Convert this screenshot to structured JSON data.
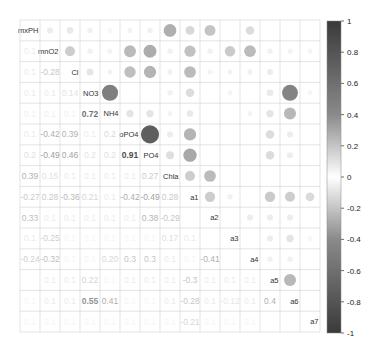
{
  "chart_data": {
    "type": "heatmap",
    "subtype": "correlation-matrix (corrplot mixed: upper=circle, lower=number, diagonal=labels)",
    "title": "",
    "variables": [
      "mxPH",
      "mnO2",
      "Cl",
      "NO3",
      "NH4",
      "oPO4",
      "PO4",
      "Chla",
      "a1",
      "a2",
      "a3",
      "a4",
      "a5",
      "a6",
      "a7"
    ],
    "colorbar": {
      "min": -1,
      "max": 1,
      "ticks": [
        "1",
        "0.8",
        "0.6",
        "0.4",
        "0.2",
        "0",
        "-0.2",
        "-0.4",
        "-0.6",
        "-0.8",
        "-1"
      ],
      "high_color": "#3a3a3a",
      "mid_color": "#ffffff",
      "low_color": "#3a3a3a"
    },
    "grid": true,
    "upper_circles": [
      {
        "r": 0,
        "c": 7,
        "v": 0.45
      },
      {
        "r": 0,
        "c": 8,
        "v": 0.22
      },
      {
        "r": 0,
        "c": 9,
        "v": 0.33
      },
      {
        "r": 0,
        "c": 11,
        "v": 0.2
      },
      {
        "r": 1,
        "c": 7,
        "v": 0.08
      },
      {
        "r": 1,
        "c": 8,
        "v": 0.35
      },
      {
        "r": 1,
        "c": 9,
        "v": 0.08
      },
      {
        "r": 1,
        "c": 10,
        "v": 0.3
      },
      {
        "r": 1,
        "c": 11,
        "v": 0.38
      },
      {
        "r": 1,
        "c": 12,
        "v": 0.08
      },
      {
        "r": 1,
        "c": 13,
        "v": 0.07
      },
      {
        "r": 1,
        "c": 14,
        "v": 0.06
      },
      {
        "r": 2,
        "c": 7,
        "v": 0.08
      },
      {
        "r": 2,
        "c": 8,
        "v": 0.38
      },
      {
        "r": 2,
        "c": 9,
        "v": 0.06
      },
      {
        "r": 2,
        "c": 10,
        "v": 0.07
      },
      {
        "r": 2,
        "c": 11,
        "v": 0.08
      },
      {
        "r": 2,
        "c": 12,
        "v": 0.1
      },
      {
        "r": 3,
        "c": 4,
        "v": 0.72
      },
      {
        "r": 3,
        "c": 7,
        "v": 0.08
      },
      {
        "r": 3,
        "c": 8,
        "v": 0.2
      },
      {
        "r": 3,
        "c": 10,
        "v": 0.06
      },
      {
        "r": 3,
        "c": 12,
        "v": 0.12
      },
      {
        "r": 3,
        "c": 13,
        "v": 0.7
      },
      {
        "r": 3,
        "c": 14,
        "v": 0.05
      },
      {
        "r": 4,
        "c": 5,
        "v": 0.15
      },
      {
        "r": 4,
        "c": 6,
        "v": 0.15
      },
      {
        "r": 4,
        "c": 7,
        "v": 0.06
      },
      {
        "r": 4,
        "c": 8,
        "v": 0.12
      },
      {
        "r": 4,
        "c": 11,
        "v": 0.06
      },
      {
        "r": 4,
        "c": 12,
        "v": 0.15
      },
      {
        "r": 4,
        "c": 13,
        "v": 0.4
      },
      {
        "r": 1,
        "c": 5,
        "v": 0.39
      },
      {
        "r": 1,
        "c": 6,
        "v": 0.46
      },
      {
        "r": 2,
        "c": 5,
        "v": 0.36
      },
      {
        "r": 2,
        "c": 6,
        "v": 0.42
      },
      {
        "r": 0,
        "c": 4,
        "v": 0.05
      },
      {
        "r": 0,
        "c": 5,
        "v": 0.07
      },
      {
        "r": 0,
        "c": 6,
        "v": 0.08
      },
      {
        "r": 0,
        "c": 1,
        "v": 0.1
      },
      {
        "r": 0,
        "c": 2,
        "v": 0.12
      },
      {
        "r": 0,
        "c": 3,
        "v": 0.08
      },
      {
        "r": 1,
        "c": 2,
        "v": 0.28
      },
      {
        "r": 1,
        "c": 3,
        "v": 0.08
      },
      {
        "r": 1,
        "c": 4,
        "v": 0.07
      },
      {
        "r": 2,
        "c": 3,
        "v": 0.14
      },
      {
        "r": 2,
        "c": 4,
        "v": 0.07
      },
      {
        "r": 5,
        "c": 6,
        "v": 0.91
      },
      {
        "r": 5,
        "c": 7,
        "v": 0.1
      },
      {
        "r": 5,
        "c": 8,
        "v": -0.42
      },
      {
        "r": 5,
        "c": 12,
        "v": 0.2
      },
      {
        "r": 5,
        "c": 13,
        "v": 0.1
      },
      {
        "r": 6,
        "c": 7,
        "v": 0.18
      },
      {
        "r": 6,
        "c": 8,
        "v": -0.49
      },
      {
        "r": 6,
        "c": 12,
        "v": 0.2
      },
      {
        "r": 6,
        "c": 13,
        "v": 0.1
      },
      {
        "r": 7,
        "c": 8,
        "v": -0.28
      },
      {
        "r": 7,
        "c": 9,
        "v": 0.38
      },
      {
        "r": 8,
        "c": 9,
        "v": -0.29
      },
      {
        "r": 8,
        "c": 10,
        "v": 0.08
      },
      {
        "r": 8,
        "c": 12,
        "v": -0.3
      },
      {
        "r": 8,
        "c": 13,
        "v": -0.28
      },
      {
        "r": 8,
        "c": 14,
        "v": -0.21
      },
      {
        "r": 9,
        "c": 11,
        "v": 0.1
      },
      {
        "r": 9,
        "c": 12,
        "v": 0.1
      },
      {
        "r": 9,
        "c": 13,
        "v": 0.1
      },
      {
        "r": 10,
        "c": 12,
        "v": 0.1
      },
      {
        "r": 10,
        "c": 13,
        "v": 0.15
      },
      {
        "r": 10,
        "c": 14,
        "v": 0.05
      },
      {
        "r": 11,
        "c": 12,
        "v": 0.08
      },
      {
        "r": 11,
        "c": 13,
        "v": 0.08
      },
      {
        "r": 12,
        "c": 13,
        "v": 0.4
      }
    ],
    "lower_numbers": [
      {
        "r": 1,
        "c": 0,
        "t": "0.1",
        "v": 0.1
      },
      {
        "r": 2,
        "c": 0,
        "t": "0.1",
        "v": 0.1
      },
      {
        "r": 2,
        "c": 1,
        "t": "-0.28",
        "v": -0.28
      },
      {
        "r": 3,
        "c": 0,
        "t": "0.1",
        "v": 0.1
      },
      {
        "r": 3,
        "c": 1,
        "t": "0.1",
        "v": 0.1
      },
      {
        "r": 3,
        "c": 2,
        "t": "0.14",
        "v": 0.14
      },
      {
        "r": 4,
        "c": 0,
        "t": "0.1",
        "v": 0.08
      },
      {
        "r": 4,
        "c": 1,
        "t": "0.1",
        "v": 0.08
      },
      {
        "r": 4,
        "c": 2,
        "t": "0.1",
        "v": 0.07
      },
      {
        "r": 4,
        "c": 3,
        "t": "0.72",
        "v": 0.72
      },
      {
        "r": 5,
        "c": 0,
        "t": "0.1",
        "v": 0.1
      },
      {
        "r": 5,
        "c": 1,
        "t": "-0.42",
        "v": -0.42
      },
      {
        "r": 5,
        "c": 2,
        "t": "0.39",
        "v": 0.39
      },
      {
        "r": 5,
        "c": 3,
        "t": "0.1",
        "v": 0.1
      },
      {
        "r": 5,
        "c": 4,
        "t": "0.2",
        "v": 0.2
      },
      {
        "r": 6,
        "c": 0,
        "t": "0.2",
        "v": 0.15
      },
      {
        "r": 6,
        "c": 1,
        "t": "-0.49",
        "v": -0.49
      },
      {
        "r": 6,
        "c": 2,
        "t": "0.46",
        "v": 0.46
      },
      {
        "r": 6,
        "c": 3,
        "t": "0.2",
        "v": 0.14
      },
      {
        "r": 6,
        "c": 4,
        "t": "0.2",
        "v": 0.15
      },
      {
        "r": 6,
        "c": 5,
        "t": "0.91",
        "v": 0.91
      },
      {
        "r": 7,
        "c": 0,
        "t": "0.39",
        "v": 0.39
      },
      {
        "r": 7,
        "c": 1,
        "t": "0.15",
        "v": 0.15
      },
      {
        "r": 7,
        "c": 2,
        "t": "0.1",
        "v": 0.1
      },
      {
        "r": 7,
        "c": 3,
        "t": "0.1",
        "v": 0.1
      },
      {
        "r": 7,
        "c": 4,
        "t": "0.1",
        "v": 0.1
      },
      {
        "r": 7,
        "c": 5,
        "t": "0.1",
        "v": 0.1
      },
      {
        "r": 7,
        "c": 6,
        "t": "0.27",
        "v": 0.27
      },
      {
        "r": 8,
        "c": 0,
        "t": "-0.27",
        "v": -0.27
      },
      {
        "r": 8,
        "c": 1,
        "t": "0.28",
        "v": 0.28
      },
      {
        "r": 8,
        "c": 2,
        "t": "-0.36",
        "v": -0.36
      },
      {
        "r": 8,
        "c": 3,
        "t": "0.21",
        "v": 0.21
      },
      {
        "r": 8,
        "c": 4,
        "t": "0.1",
        "v": 0.1
      },
      {
        "r": 8,
        "c": 5,
        "t": "-0.42",
        "v": -0.42
      },
      {
        "r": 8,
        "c": 6,
        "t": "-0.49",
        "v": -0.49
      },
      {
        "r": 8,
        "c": 7,
        "t": "0.28",
        "v": 0.28
      },
      {
        "r": 9,
        "c": 0,
        "t": "0.33",
        "v": 0.33
      },
      {
        "r": 9,
        "c": 1,
        "t": "0.1",
        "v": 0.1
      },
      {
        "r": 9,
        "c": 2,
        "t": "0.1",
        "v": 0.1
      },
      {
        "r": 9,
        "c": 3,
        "t": "0.1",
        "v": 0.1
      },
      {
        "r": 9,
        "c": 4,
        "t": "0.1",
        "v": 0.1
      },
      {
        "r": 9,
        "c": 5,
        "t": "0.1",
        "v": 0.1
      },
      {
        "r": 9,
        "c": 6,
        "t": "0.38",
        "v": 0.38
      },
      {
        "r": 9,
        "c": 7,
        "t": "-0.29",
        "v": -0.29
      },
      {
        "r": 10,
        "c": 0,
        "t": "0.1",
        "v": 0.1
      },
      {
        "r": 10,
        "c": 1,
        "t": "-0.25",
        "v": -0.25
      },
      {
        "r": 10,
        "c": 2,
        "t": "0.1",
        "v": 0.05
      },
      {
        "r": 10,
        "c": 3,
        "t": "0.1",
        "v": 0.05
      },
      {
        "r": 10,
        "c": 4,
        "t": "0.1",
        "v": 0.05
      },
      {
        "r": 10,
        "c": 5,
        "t": "0.1",
        "v": 0.05
      },
      {
        "r": 10,
        "c": 6,
        "t": "0.1",
        "v": 0.05
      },
      {
        "r": 10,
        "c": 7,
        "t": "0.17",
        "v": 0.17
      },
      {
        "r": 10,
        "c": 8,
        "t": "0.1",
        "v": 0.1
      },
      {
        "r": 11,
        "c": 0,
        "t": "-0.24",
        "v": -0.24
      },
      {
        "r": 11,
        "c": 1,
        "t": "-0.32",
        "v": -0.32
      },
      {
        "r": 11,
        "c": 2,
        "t": "0.1",
        "v": 0.05
      },
      {
        "r": 11,
        "c": 3,
        "t": "0.1",
        "v": 0.05
      },
      {
        "r": 11,
        "c": 4,
        "t": "0.20",
        "v": 0.2
      },
      {
        "r": 11,
        "c": 5,
        "t": "0.3",
        "v": 0.3
      },
      {
        "r": 11,
        "c": 6,
        "t": "0.3",
        "v": 0.3
      },
      {
        "r": 11,
        "c": 7,
        "t": "0.1",
        "v": 0.1
      },
      {
        "r": 11,
        "c": 8,
        "t": "0.1",
        "v": 0.05
      },
      {
        "r": 11,
        "c": 9,
        "t": "-0.41",
        "v": -0.41
      },
      {
        "r": 12,
        "c": 1,
        "t": "0.1",
        "v": 0.1
      },
      {
        "r": 12,
        "c": 2,
        "t": "0.1",
        "v": 0.1
      },
      {
        "r": 12,
        "c": 3,
        "t": "0.22",
        "v": 0.22
      },
      {
        "r": 12,
        "c": 4,
        "t": "0.1",
        "v": 0.05
      },
      {
        "r": 12,
        "c": 5,
        "t": "0.1",
        "v": 0.1
      },
      {
        "r": 12,
        "c": 6,
        "t": "0.1",
        "v": 0.1
      },
      {
        "r": 12,
        "c": 7,
        "t": "0.1",
        "v": 0.1
      },
      {
        "r": 12,
        "c": 8,
        "t": "-0.3",
        "v": -0.3
      },
      {
        "r": 12,
        "c": 9,
        "t": "0.1",
        "v": 0.1
      },
      {
        "r": 12,
        "c": 10,
        "t": "0.1",
        "v": 0.1
      },
      {
        "r": 12,
        "c": 11,
        "t": "0.1",
        "v": 0.1
      },
      {
        "r": 13,
        "c": 0,
        "t": "0.1",
        "v": 0.05
      },
      {
        "r": 13,
        "c": 1,
        "t": "0.1",
        "v": 0.1
      },
      {
        "r": 13,
        "c": 2,
        "t": "0.1",
        "v": 0.1
      },
      {
        "r": 13,
        "c": 3,
        "t": "0.55",
        "v": 0.55
      },
      {
        "r": 13,
        "c": 4,
        "t": "0.41",
        "v": 0.41
      },
      {
        "r": 13,
        "c": 5,
        "t": "0.1",
        "v": 0.05
      },
      {
        "r": 13,
        "c": 6,
        "t": "0.1",
        "v": 0.05
      },
      {
        "r": 13,
        "c": 7,
        "t": "0.1",
        "v": 0.1
      },
      {
        "r": 13,
        "c": 8,
        "t": "-0.28",
        "v": -0.28
      },
      {
        "r": 13,
        "c": 9,
        "t": "0.1",
        "v": 0.1
      },
      {
        "r": 13,
        "c": 10,
        "t": "-0.12",
        "v": -0.12
      },
      {
        "r": 13,
        "c": 11,
        "t": "0.1",
        "v": 0.1
      },
      {
        "r": 13,
        "c": 12,
        "t": "0.4",
        "v": 0.4
      },
      {
        "r": 14,
        "c": 0,
        "t": "0.1",
        "v": 0.05
      },
      {
        "r": 14,
        "c": 1,
        "t": "0.1",
        "v": 0.05
      },
      {
        "r": 14,
        "c": 2,
        "t": "0.1",
        "v": 0.05
      },
      {
        "r": 14,
        "c": 3,
        "t": "0.1",
        "v": 0.05
      },
      {
        "r": 14,
        "c": 4,
        "t": "0.1",
        "v": 0.05
      },
      {
        "r": 14,
        "c": 5,
        "t": "0.1",
        "v": 0.05
      },
      {
        "r": 14,
        "c": 6,
        "t": "0.1",
        "v": 0.05
      },
      {
        "r": 14,
        "c": 7,
        "t": "0.1",
        "v": 0.05
      },
      {
        "r": 14,
        "c": 8,
        "t": "-0.21",
        "v": -0.21
      },
      {
        "r": 14,
        "c": 9,
        "t": "0.1",
        "v": 0.05
      },
      {
        "r": 14,
        "c": 10,
        "t": "0.1",
        "v": 0.05
      },
      {
        "r": 14,
        "c": 11,
        "t": "0.1",
        "v": 0.05
      }
    ],
    "highlighted_values": {
      "NO3-NH4": 0.72,
      "oPO4-PO4": 0.91,
      "NO3-a6": 0.55,
      "NH4-a6": 0.41,
      "mnO2-oPO4": -0.42,
      "Cl-oPO4": 0.39,
      "mnO2-PO4": -0.49,
      "Cl-PO4": 0.46,
      "mxPH-Chla": 0.39,
      "oPO4-a1": -0.42,
      "PO4-a1": -0.49,
      "a5-a6": 0.4
    }
  }
}
